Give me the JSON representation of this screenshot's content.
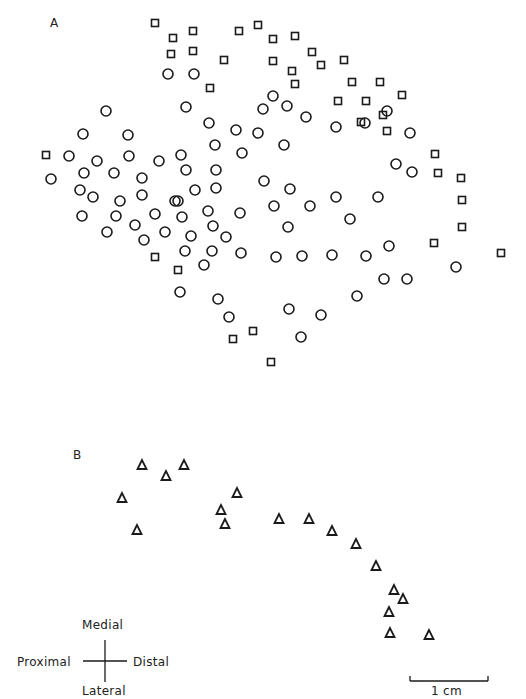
{
  "figure": {
    "panel_a_label": "A",
    "panel_b_label": "B",
    "orientation": {
      "top": "Medial",
      "bottom": "Lateral",
      "left": "Proximal",
      "right": "Distal"
    },
    "scale_bar": {
      "label": "1 cm",
      "length_px": 78
    },
    "colors": {
      "ink": "#1a1a1a",
      "background": "#ffffff"
    },
    "markers": {
      "circle": "open-circle",
      "square": "open-square",
      "triangle": "open-triangle"
    }
  },
  "chart_data": [
    {
      "type": "scatter",
      "title": "A",
      "series": [
        {
          "name": "squares",
          "marker": "open-square",
          "points": [
            [
              155,
              23
            ],
            [
              173,
              38
            ],
            [
              193,
              31
            ],
            [
              239,
              31
            ],
            [
              258,
              25
            ],
            [
              273,
              39
            ],
            [
              295,
              36
            ],
            [
              171,
              54
            ],
            [
              193,
              51
            ],
            [
              224,
              60
            ],
            [
              273,
              61
            ],
            [
              312,
              52
            ],
            [
              321,
              65
            ],
            [
              344,
              60
            ],
            [
              292,
              71
            ],
            [
              295,
              84
            ],
            [
              210,
              88
            ],
            [
              352,
              82
            ],
            [
              380,
              82
            ],
            [
              402,
              95
            ],
            [
              338,
              101
            ],
            [
              366,
              101
            ],
            [
              383,
              115
            ],
            [
              361,
              122
            ],
            [
              387,
              131
            ],
            [
              435,
              154
            ],
            [
              438,
              173
            ],
            [
              461,
              178
            ],
            [
              462,
              200
            ],
            [
              462,
              227
            ],
            [
              434,
              243
            ],
            [
              501,
              253
            ],
            [
              155,
              257
            ],
            [
              178,
              270
            ],
            [
              253,
              331
            ],
            [
              233,
              339
            ],
            [
              271,
              362
            ],
            [
              46,
              155
            ]
          ]
        },
        {
          "name": "circles",
          "marker": "open-circle",
          "points": [
            [
              168,
              74
            ],
            [
              194,
              74
            ],
            [
              106,
              111
            ],
            [
              186,
              107
            ],
            [
              273,
              96
            ],
            [
              263,
              109
            ],
            [
              287,
              106
            ],
            [
              209,
              123
            ],
            [
              236,
              130
            ],
            [
              258,
              133
            ],
            [
              306,
              117
            ],
            [
              336,
              127
            ],
            [
              365,
              123
            ],
            [
              387,
              111
            ],
            [
              410,
              133
            ],
            [
              83,
              134
            ],
            [
              128,
              135
            ],
            [
              69,
              156
            ],
            [
              97,
              161
            ],
            [
              129,
              156
            ],
            [
              159,
              161
            ],
            [
              181,
              155
            ],
            [
              215,
              145
            ],
            [
              242,
              153
            ],
            [
              284,
              145
            ],
            [
              51,
              179
            ],
            [
              84,
              173
            ],
            [
              114,
              173
            ],
            [
              142,
              178
            ],
            [
              186,
              170
            ],
            [
              216,
              170
            ],
            [
              264,
              181
            ],
            [
              290,
              189
            ],
            [
              336,
              197
            ],
            [
              378,
              197
            ],
            [
              396,
              164
            ],
            [
              412,
              172
            ],
            [
              80,
              190
            ],
            [
              93,
              197
            ],
            [
              120,
              201
            ],
            [
              142,
              195
            ],
            [
              175,
              201
            ],
            [
              195,
              190
            ],
            [
              216,
              188
            ],
            [
              82,
              216
            ],
            [
              116,
              216
            ],
            [
              155,
              214
            ],
            [
              178,
              201
            ],
            [
              208,
              211
            ],
            [
              274,
              206
            ],
            [
              310,
              206
            ],
            [
              350,
              219
            ],
            [
              107,
              232
            ],
            [
              135,
              225
            ],
            [
              182,
              217
            ],
            [
              213,
              226
            ],
            [
              240,
              213
            ],
            [
              288,
              227
            ],
            [
              144,
              240
            ],
            [
              165,
              232
            ],
            [
              191,
              236
            ],
            [
              226,
              237
            ],
            [
              185,
              251
            ],
            [
              212,
              251
            ],
            [
              241,
              253
            ],
            [
              276,
              257
            ],
            [
              302,
              256
            ],
            [
              332,
              255
            ],
            [
              366,
              256
            ],
            [
              389,
              246
            ],
            [
              204,
              265
            ],
            [
              180,
              292
            ],
            [
              218,
              299
            ],
            [
              229,
              317
            ],
            [
              289,
              309
            ],
            [
              321,
              315
            ],
            [
              301,
              337
            ],
            [
              357,
              296
            ],
            [
              384,
              279
            ],
            [
              407,
              279
            ],
            [
              456,
              267
            ]
          ]
        }
      ],
      "xlabel": "",
      "ylabel": "",
      "grid": false
    },
    {
      "type": "scatter",
      "title": "B",
      "series": [
        {
          "name": "triangles",
          "marker": "open-triangle",
          "points": [
            [
              142,
              465
            ],
            [
              166,
              476
            ],
            [
              184,
              465
            ],
            [
              122,
              498
            ],
            [
              137,
              530
            ],
            [
              237,
              493
            ],
            [
              221,
              510
            ],
            [
              225,
              524
            ],
            [
              279,
              519
            ],
            [
              309,
              519
            ],
            [
              332,
              531
            ],
            [
              356,
              544
            ],
            [
              376,
              566
            ],
            [
              394,
              590
            ],
            [
              403,
              599
            ],
            [
              389,
              612
            ],
            [
              390,
              633
            ],
            [
              429,
              635
            ]
          ]
        }
      ],
      "xlabel": "",
      "ylabel": "",
      "grid": false
    }
  ]
}
